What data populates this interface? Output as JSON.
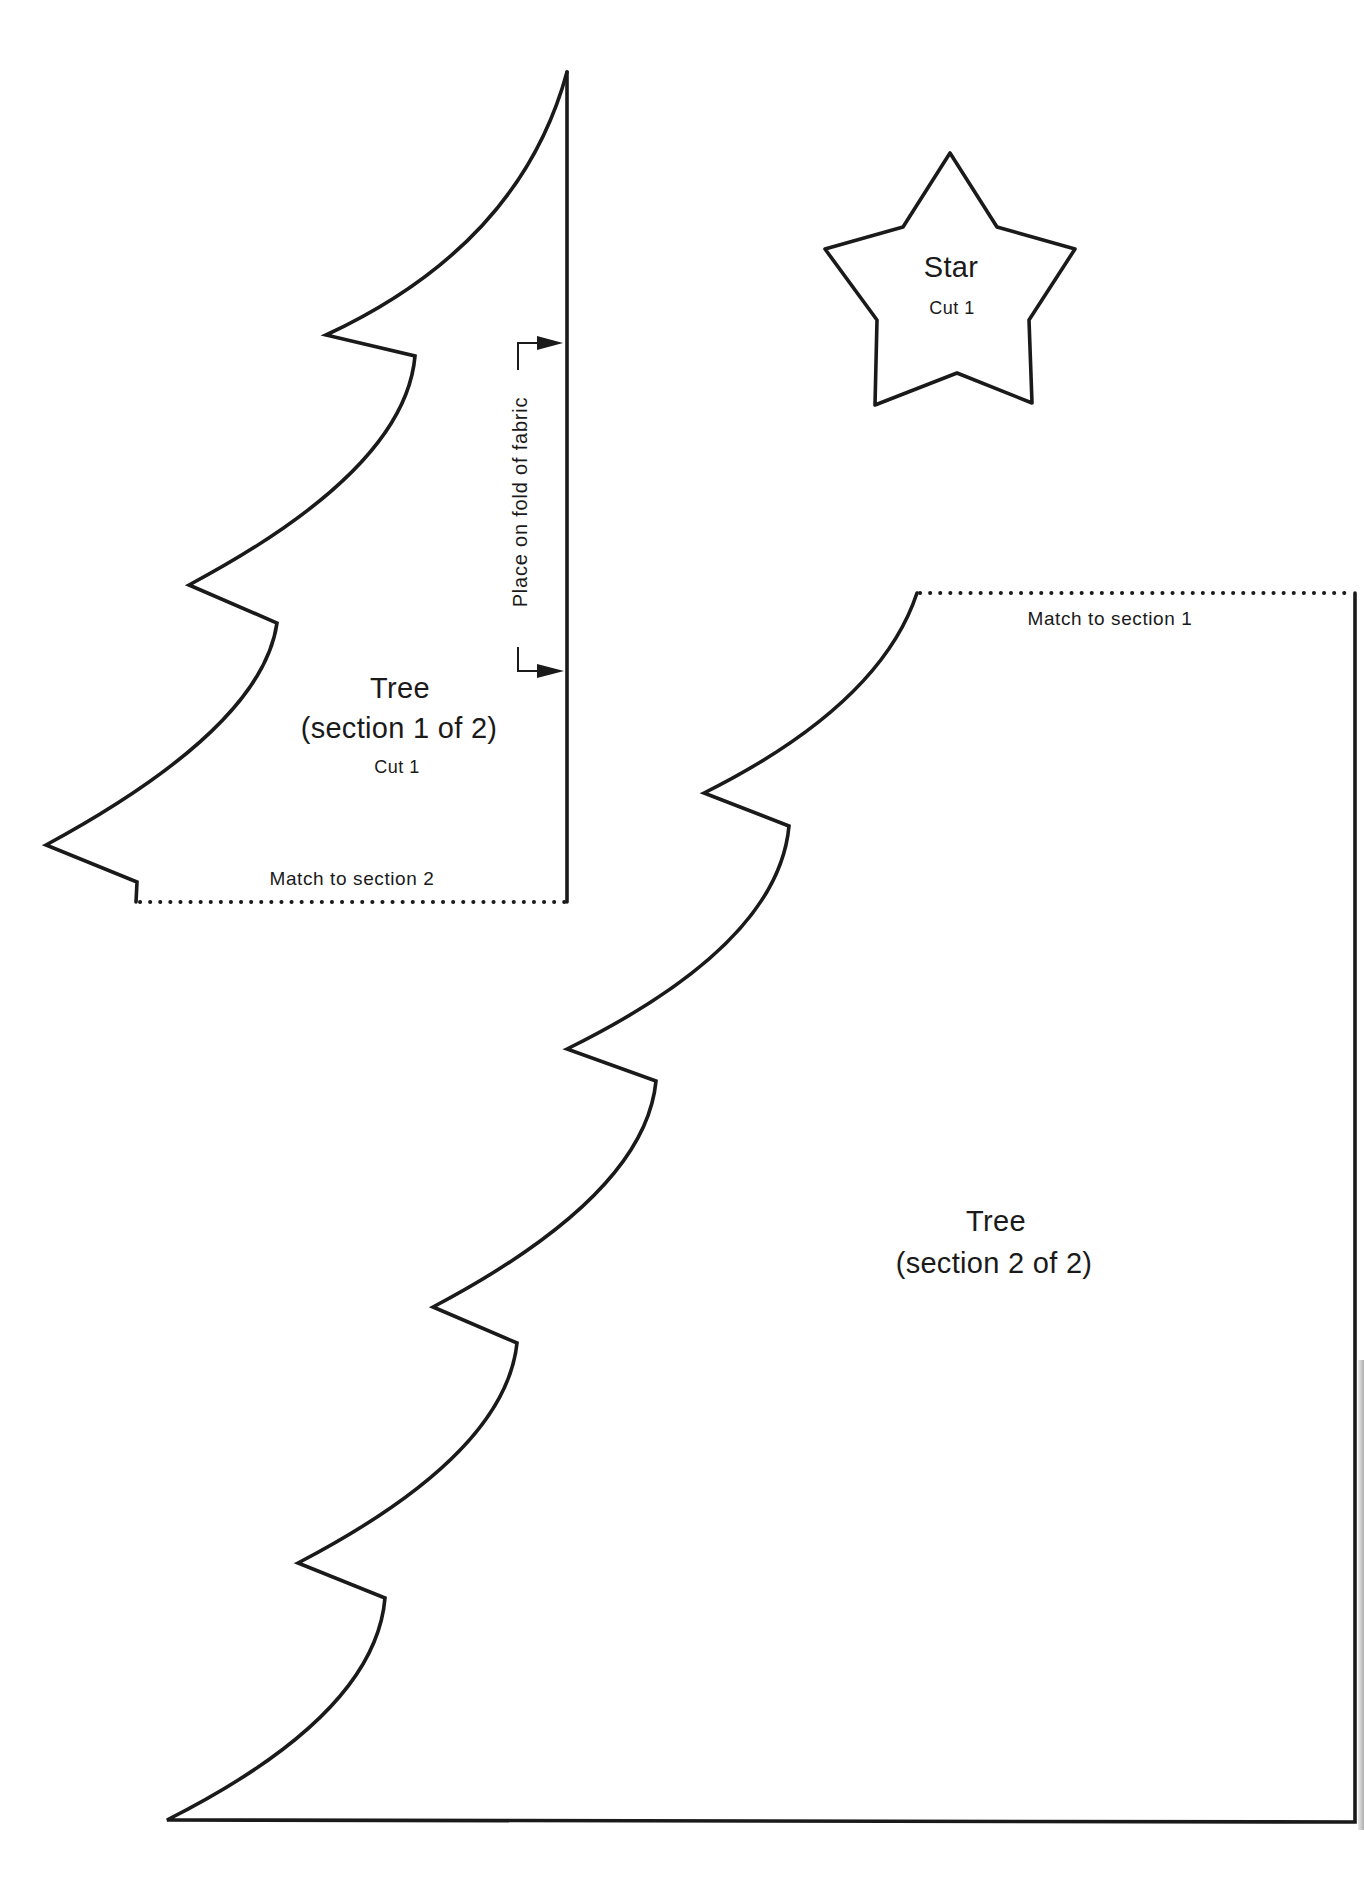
{
  "document": {
    "type": "sewing-pattern",
    "colors": {
      "ink": "#1a1a1a",
      "paper": "#ffffff"
    }
  },
  "pieces": {
    "tree_section_1": {
      "title": "Tree",
      "subtitle": "(section 1 of 2)",
      "cut": "Cut 1",
      "match_label": "Match to section 2",
      "fold_label": "Place on fold of fabric",
      "fold_arrow_icon": "fold-arrow-icon"
    },
    "tree_section_2": {
      "title": "Tree",
      "subtitle": "(section 2 of 2)",
      "match_label": "Match to section 1"
    },
    "star": {
      "title": "Star",
      "cut": "Cut 1"
    }
  }
}
